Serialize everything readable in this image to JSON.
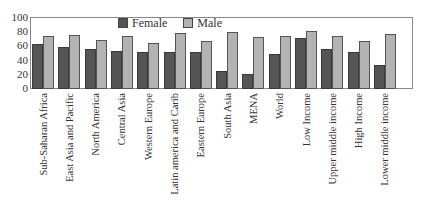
{
  "chart_data": {
    "type": "bar",
    "title": "",
    "xlabel": "",
    "ylabel": "",
    "ylim": [
      0,
      100
    ],
    "yticks": [
      0,
      20,
      40,
      60,
      80,
      100
    ],
    "grid": false,
    "legend_position": "top-center-inside",
    "categories": [
      "Sub-Saharan Africa",
      "East Asia and Pacific",
      "North America",
      "Central Asia",
      "Western Europe",
      "Latin america and Carib",
      "Eastern Europe",
      "South Asia",
      "MENA",
      "World",
      "Low Income",
      "Upper middle income",
      "High Income",
      "Lower middle income"
    ],
    "series": [
      {
        "name": "Female",
        "color": "#555555",
        "values": [
          62,
          59,
          56,
          53,
          52,
          51,
          51,
          25,
          21,
          48,
          71,
          56,
          52,
          33
        ]
      },
      {
        "name": "Male",
        "color": "#b3b3b3",
        "values": [
          73,
          75,
          68,
          73,
          64,
          78,
          67,
          79,
          72,
          74,
          80,
          73,
          67,
          76
        ]
      }
    ]
  },
  "legend": {
    "female": "Female",
    "male": "Male"
  },
  "yaxis": {
    "t0": "0",
    "t20": "20",
    "t40": "40",
    "t60": "60",
    "t80": "80",
    "t100": "100"
  }
}
